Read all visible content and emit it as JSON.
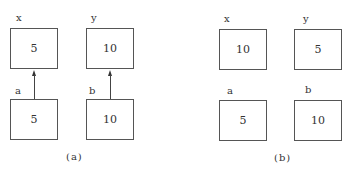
{
  "panel_a": {
    "caption": "(a)",
    "top_row": [
      {
        "label": "x",
        "value": "5"
      },
      {
        "label": "y",
        "value": "10"
      }
    ],
    "bottom_row": [
      {
        "label": "a",
        "value": "5"
      },
      {
        "label": "b",
        "value": "10"
      }
    ],
    "arrows": [
      {
        "from": "a",
        "to": "x"
      },
      {
        "from": "b",
        "to": "y"
      }
    ]
  },
  "panel_b": {
    "caption": "(b)",
    "top_row": [
      {
        "label": "x",
        "value": "10"
      },
      {
        "label": "y",
        "value": "5"
      }
    ],
    "bottom_row": [
      {
        "label": "a",
        "value": "5"
      },
      {
        "label": "b",
        "value": "10"
      }
    ]
  }
}
